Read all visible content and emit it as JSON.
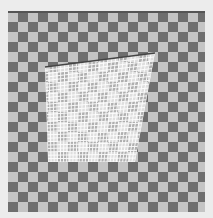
{
  "image": {
    "description": "Checkerboard pattern with a perspective-warped white grid overlay",
    "background": "#ececec",
    "board": {
      "dark": "#6e6e6e",
      "light": "#c4c4c4",
      "cell_px": 10
    },
    "overlay": {
      "quad": [
        [
          45,
          67
        ],
        [
          155,
          53
        ],
        [
          135,
          162
        ],
        [
          48,
          162
        ]
      ],
      "grid_color": "#ffffff",
      "edge_color": "#444444"
    }
  }
}
